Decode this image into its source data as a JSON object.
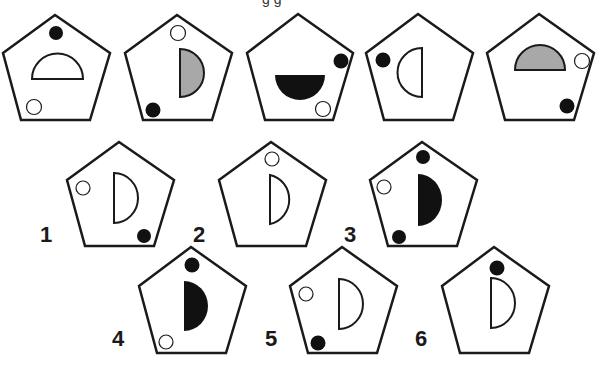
{
  "caption": "g g",
  "colors": {
    "stroke": "#1a1a1a",
    "black": "#111111",
    "gray": "#a8a8a8",
    "white": "#ffffff"
  },
  "sequence": [
    {
      "index": 1,
      "semicircle": {
        "orientation": "up",
        "fill": "white"
      },
      "black_dot": "top",
      "white_dot": "bottom-left"
    },
    {
      "index": 2,
      "semicircle": {
        "orientation": "right",
        "fill": "gray"
      },
      "black_dot": "bottom-left",
      "white_dot": "top"
    },
    {
      "index": 3,
      "semicircle": {
        "orientation": "down",
        "fill": "black"
      },
      "black_dot": "right",
      "white_dot": "bottom-right"
    },
    {
      "index": 4,
      "semicircle": {
        "orientation": "left",
        "fill": "white"
      },
      "black_dot": "left",
      "white_dot": "none"
    },
    {
      "index": 5,
      "semicircle": {
        "orientation": "up",
        "fill": "gray"
      },
      "black_dot": "bottom-right",
      "white_dot": "right"
    }
  ],
  "options": [
    {
      "label": "1",
      "semicircle": {
        "orientation": "right",
        "fill": "white"
      },
      "black_dot": "bottom-right",
      "white_dot": "left"
    },
    {
      "label": "2",
      "semicircle": {
        "orientation": "right",
        "fill": "white"
      },
      "black_dot": "none",
      "white_dot": "top"
    },
    {
      "label": "3",
      "semicircle": {
        "orientation": "right",
        "fill": "black"
      },
      "black_dot": "top and bottom-left",
      "white_dot": "left"
    },
    {
      "label": "4",
      "semicircle": {
        "orientation": "right",
        "fill": "black"
      },
      "black_dot": "top",
      "white_dot": "bottom-left"
    },
    {
      "label": "5",
      "semicircle": {
        "orientation": "right",
        "fill": "white"
      },
      "black_dot": "bottom-left",
      "white_dot": "left"
    },
    {
      "label": "6",
      "semicircle": {
        "orientation": "right",
        "fill": "white"
      },
      "black_dot": "top",
      "white_dot": "none"
    }
  ]
}
